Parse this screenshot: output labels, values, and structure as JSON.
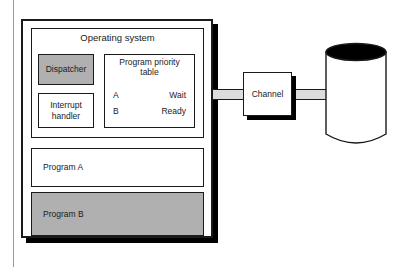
{
  "diagram": {
    "type": "block-diagram",
    "colors": {
      "fill_gray": "#b0b0b0",
      "connector_gray": "#dcdcdc",
      "stroke": "#1a1a1a",
      "shadow": "#000000",
      "background": "#ffffff"
    }
  },
  "main_memory": {
    "name": "main-memory-block",
    "operating_system": {
      "title": "Operating system",
      "dispatcher": {
        "label": "Dispatcher",
        "shaded": true
      },
      "interrupt_handler": {
        "label": "Interrupt\nhandler",
        "shaded": false
      },
      "program_priority_table": {
        "title": "Program priority\ntable",
        "rows": [
          {
            "program": "A",
            "status": "Wait"
          },
          {
            "program": "B",
            "status": "Ready"
          }
        ]
      }
    },
    "programs": [
      {
        "label": "Program A",
        "shaded": false
      },
      {
        "label": "Program B",
        "shaded": true
      }
    ]
  },
  "channel": {
    "label": "Channel"
  },
  "disk": {
    "name": "disk-drive",
    "label": ""
  },
  "connectors": [
    {
      "name": "memory-to-channel",
      "from": "main-memory-block",
      "to": "channel"
    },
    {
      "name": "channel-to-disk",
      "from": "channel",
      "to": "disk-drive"
    }
  ]
}
